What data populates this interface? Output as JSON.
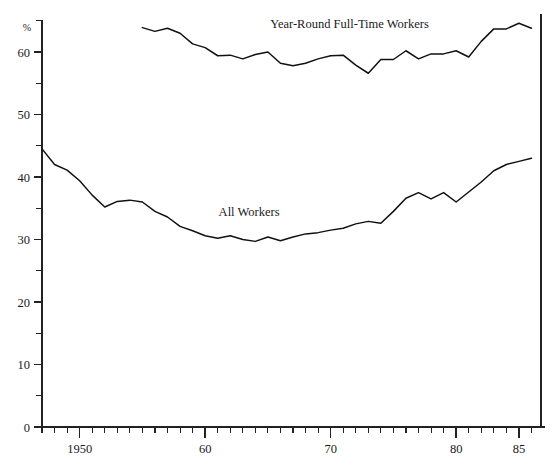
{
  "chart_data": {
    "type": "line",
    "title": "",
    "xlabel": "",
    "ylabel": "%",
    "ylim": [
      0,
      66
    ],
    "xlim": [
      1947,
      1987
    ],
    "grid": false,
    "legend_position": "inline-annotation",
    "y_ticks_major": [
      0,
      10,
      20,
      30,
      40,
      50,
      60
    ],
    "y_ticks_major_labels": [
      "0",
      "10",
      "20",
      "30",
      "40",
      "50",
      "60"
    ],
    "y_ticks_minor": [
      5,
      15,
      25,
      35,
      45,
      55,
      65
    ],
    "x_ticks_major": [
      1950,
      1960,
      1970,
      1980,
      1985
    ],
    "x_ticks_major_labels": [
      "1950",
      "60",
      "70",
      "80",
      "85"
    ],
    "x_tick_step_minor": 1,
    "x_minor_start": 1947,
    "x_minor_end": 1987,
    "series": [
      {
        "name": "Year-Round Full-Time Workers",
        "label": "Year-Round Full-Time Workers",
        "label_x": 1971.5,
        "label_y": 63.8,
        "color": "#111111",
        "x": [
          1955,
          1956,
          1957,
          1958,
          1959,
          1960,
          1961,
          1962,
          1963,
          1964,
          1965,
          1966,
          1967,
          1968,
          1969,
          1970,
          1971,
          1972,
          1973,
          1974,
          1975,
          1976,
          1977,
          1978,
          1979,
          1980,
          1981,
          1982,
          1983,
          1984,
          1985,
          1986
        ],
        "y": [
          63.9,
          63.3,
          63.8,
          63.0,
          61.3,
          60.7,
          59.4,
          59.5,
          58.9,
          59.6,
          60.0,
          58.2,
          57.8,
          58.2,
          58.9,
          59.4,
          59.5,
          57.9,
          56.6,
          58.8,
          58.8,
          60.2,
          58.9,
          59.7,
          59.7,
          60.2,
          59.2,
          61.7,
          63.7,
          63.7,
          64.6,
          63.8
        ]
      },
      {
        "name": "All Workers",
        "label": "All Workers",
        "label_x": 1963.5,
        "label_y": 33.8,
        "color": "#111111",
        "x": [
          1947,
          1948,
          1949,
          1950,
          1951,
          1952,
          1953,
          1954,
          1955,
          1956,
          1957,
          1958,
          1959,
          1960,
          1961,
          1962,
          1963,
          1964,
          1965,
          1966,
          1967,
          1968,
          1969,
          1970,
          1971,
          1972,
          1973,
          1974,
          1975,
          1976,
          1977,
          1978,
          1979,
          1980,
          1981,
          1982,
          1983,
          1984,
          1985,
          1986
        ],
        "y": [
          44.5,
          42.0,
          41.1,
          39.4,
          37.1,
          35.2,
          36.1,
          36.3,
          36.0,
          34.5,
          33.6,
          32.1,
          31.4,
          30.6,
          30.2,
          30.6,
          30.0,
          29.7,
          30.4,
          29.8,
          30.4,
          30.9,
          31.1,
          31.5,
          31.8,
          32.5,
          32.9,
          32.6,
          34.5,
          36.6,
          37.5,
          36.5,
          37.5,
          36.0,
          37.6,
          39.2,
          41.0,
          42.0,
          42.5,
          43.0
        ]
      }
    ]
  },
  "axes": {
    "y_axis_unit": "%",
    "y_axis_name": "percent-axis",
    "x_axis_name": "year-axis"
  }
}
